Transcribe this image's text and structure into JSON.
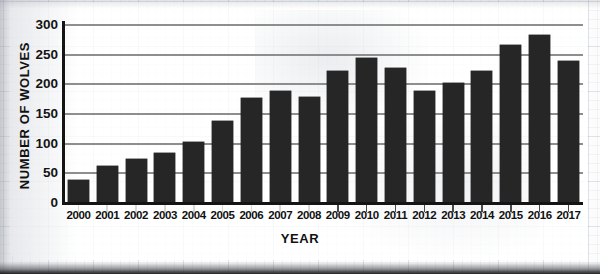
{
  "chart_data": {
    "type": "bar",
    "title": "",
    "subtitle": "",
    "xlabel": "YEAR",
    "ylabel": "NUMBER OF WOLVES",
    "categories": [
      "2000",
      "2001",
      "2002",
      "2003",
      "2004",
      "2005",
      "2006",
      "2007",
      "2008",
      "2009",
      "2010",
      "2011",
      "2012",
      "2013",
      "2014",
      "2015",
      "2016",
      "2017"
    ],
    "values": [
      37,
      61,
      72,
      83,
      101,
      137,
      176,
      187,
      177,
      221,
      242,
      226,
      187,
      201,
      221,
      265,
      282,
      237
    ],
    "series": [
      {
        "name": "Number of wolves",
        "values": [
          37,
          61,
          72,
          83,
          101,
          137,
          176,
          187,
          177,
          221,
          242,
          226,
          187,
          201,
          221,
          265,
          282,
          237
        ]
      }
    ],
    "ylim": [
      0,
      300
    ],
    "yticks": [
      0,
      50,
      100,
      150,
      200,
      250,
      300
    ],
    "ytick_labels": [
      "0",
      "50",
      "100",
      "150",
      "200",
      "250",
      "300"
    ],
    "grid": "horizontal",
    "legend": "none",
    "bar_color": "#262626",
    "gridline_color": "#8e8e8e",
    "axis_color": "#141414",
    "background": "#fcfcfd"
  },
  "axes": {
    "y_title": "NUMBER OF WOLVES",
    "x_title": "YEAR"
  },
  "page": {
    "cropped_top_text": ""
  }
}
